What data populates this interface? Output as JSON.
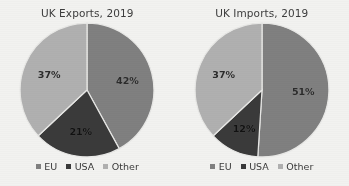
{
  "figure": {
    "background": "#f2f2f0",
    "colors": {
      "eu": "#808080",
      "usa": "#3a3a3a",
      "other": "#b0b0b0",
      "slice_border": "#e8e8e6",
      "text": "#3d3d3d"
    }
  },
  "legend": {
    "items": [
      {
        "label": "EU",
        "color": "#808080",
        "marker": "square-swatch-icon"
      },
      {
        "label": "USA",
        "color": "#3a3a3a",
        "marker": "square-swatch-icon"
      },
      {
        "label": "Other",
        "color": "#b0b0b0",
        "marker": "square-swatch-icon"
      }
    ]
  },
  "chart_data": [
    {
      "type": "pie",
      "title": "UK Exports, 2019",
      "xlabel": "",
      "ylabel": "",
      "legend_position": "bottom",
      "grid": false,
      "categories": [
        "EU",
        "USA",
        "Other"
      ],
      "values": [
        42,
        21,
        37
      ],
      "labels": [
        "42%",
        "21%",
        "37%"
      ],
      "colors": [
        "#808080",
        "#3a3a3a",
        "#b0b0b0"
      ],
      "start_angle_deg": 0,
      "direction": "clockwise",
      "units": "percent"
    },
    {
      "type": "pie",
      "title": "UK Imports, 2019",
      "xlabel": "",
      "ylabel": "",
      "legend_position": "bottom",
      "grid": false,
      "categories": [
        "EU",
        "USA",
        "Other"
      ],
      "values": [
        51,
        12,
        37
      ],
      "labels": [
        "51%",
        "12%",
        "37%"
      ],
      "colors": [
        "#808080",
        "#3a3a3a",
        "#b0b0b0"
      ],
      "start_angle_deg": 0,
      "direction": "clockwise",
      "units": "percent"
    }
  ]
}
